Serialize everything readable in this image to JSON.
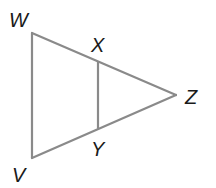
{
  "diagram": {
    "type": "geometry-triangle",
    "stroke_color": "#8a8a8a",
    "label_color": "#1a1a1a",
    "points": {
      "W": {
        "label": "W",
        "x": 32,
        "y": 33
      },
      "V": {
        "label": "V",
        "x": 32,
        "y": 158
      },
      "Z": {
        "label": "Z",
        "x": 176,
        "y": 95
      },
      "X": {
        "label": "X",
        "x": 98,
        "y": 62
      },
      "Y": {
        "label": "Y",
        "x": 98,
        "y": 128
      }
    },
    "segments": [
      "WZ",
      "VZ",
      "WV",
      "XY"
    ]
  }
}
